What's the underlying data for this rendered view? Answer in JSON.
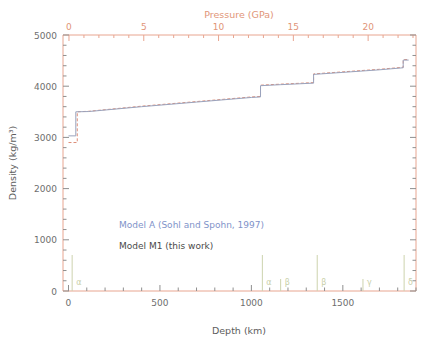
{
  "figure": {
    "background": "#ffffff",
    "frame_color": "#e8a590"
  },
  "axes": {
    "top": {
      "title": "Pressure (GPa)",
      "ticks": [
        0,
        5,
        10,
        15,
        20
      ],
      "range": [
        -0.4,
        23.2
      ],
      "color": "#e19578"
    },
    "bottom": {
      "title": "Depth (km)",
      "ticks": [
        0,
        500,
        1000,
        1500
      ],
      "range": [
        -30,
        1900
      ],
      "color": "#6e6e6e"
    },
    "left": {
      "title": "Density (kg/m³)",
      "ticks": [
        0,
        1000,
        2000,
        3000,
        4000,
        5000
      ],
      "range": [
        0,
        5000
      ],
      "color": "#6e6e6e"
    }
  },
  "legend": {
    "entries": [
      {
        "label": "Model A (Sohl and Spohn, 1997)",
        "color": "#7f93c9"
      },
      {
        "label": "Model M1 (this work)",
        "color": "#4a4a4a"
      }
    ]
  },
  "phases": {
    "color": "#c9cfa8",
    "markers": [
      {
        "label": "α",
        "depth": 20
      },
      {
        "label": "α",
        "depth": 1060
      },
      {
        "label": "β",
        "depth": 1160
      },
      {
        "label": "β",
        "depth": 1360
      },
      {
        "label": "γ",
        "depth": 1610
      },
      {
        "label": "δ",
        "depth": 1835
      }
    ]
  },
  "chart_data": {
    "type": "line",
    "title": "",
    "xlabel": "Depth (km)",
    "ylabel": "Density (kg/m³)",
    "xlabel_top": "Pressure (GPa)",
    "xlim": [
      -30,
      1900
    ],
    "ylim": [
      0,
      5000
    ],
    "xlim_top": [
      -0.4,
      23.2
    ],
    "grid": false,
    "legend_position": "center-left",
    "series": [
      {
        "name": "Model A (Sohl and Spohn, 1997)",
        "color": "#dd8e78",
        "style": "dashed",
        "points": [
          [
            0,
            2900
          ],
          [
            48,
            2900
          ],
          [
            48,
            3500
          ],
          [
            110,
            3510
          ],
          [
            400,
            3610
          ],
          [
            700,
            3700
          ],
          [
            1000,
            3790
          ],
          [
            1050,
            3800
          ],
          [
            1050,
            4020
          ],
          [
            1160,
            4040
          ],
          [
            1340,
            4070
          ],
          [
            1340,
            4240
          ],
          [
            1500,
            4280
          ],
          [
            1700,
            4330
          ],
          [
            1830,
            4370
          ],
          [
            1830,
            4520
          ],
          [
            1860,
            4520
          ]
        ]
      },
      {
        "name": "Model M1 (this work)",
        "color": "#9aa3bd",
        "style": "solid",
        "points": [
          [
            0,
            3030
          ],
          [
            40,
            3030
          ],
          [
            40,
            3500
          ],
          [
            110,
            3505
          ],
          [
            400,
            3600
          ],
          [
            700,
            3690
          ],
          [
            1000,
            3780
          ],
          [
            1050,
            3790
          ],
          [
            1050,
            4010
          ],
          [
            1160,
            4030
          ],
          [
            1340,
            4060
          ],
          [
            1340,
            4230
          ],
          [
            1500,
            4270
          ],
          [
            1700,
            4320
          ],
          [
            1830,
            4360
          ],
          [
            1830,
            4510
          ],
          [
            1860,
            4510
          ]
        ]
      }
    ],
    "annotations": [
      {
        "text": "α",
        "x": 20
      },
      {
        "text": "α",
        "x": 1060
      },
      {
        "text": "β",
        "x": 1160
      },
      {
        "text": "β",
        "x": 1360
      },
      {
        "text": "γ",
        "x": 1610
      },
      {
        "text": "δ",
        "x": 1835
      }
    ]
  }
}
